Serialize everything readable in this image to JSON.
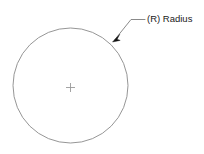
{
  "diagram": {
    "background_color": "#ffffff",
    "geometry": {
      "circle": {
        "name": "circle-outline",
        "center_x": 70.5,
        "center_y": 85.5,
        "radius": 57.5,
        "stroke_color": "#8a8a8a",
        "stroke_width": 0.9,
        "fill": "none"
      },
      "center_mark": {
        "name": "center-plus-mark",
        "x": 70.5,
        "y": 87.5,
        "arm_length": 4.5,
        "stroke_color": "#9a9a9a",
        "stroke_width": 0.9,
        "glyph": "+"
      }
    },
    "callout": {
      "label": "(R) Radius",
      "label_x": 147,
      "label_y": 22,
      "text_color": "#1a1a1a",
      "leader": {
        "name": "leader-line",
        "stroke_color": "#7d7d7d",
        "stroke_width": 0.9,
        "points": "114.5,40 131,19.5 145,19.5"
      },
      "arrowhead": {
        "name": "leader-arrowhead",
        "fill_color": "#121212",
        "tip_x": 112.5,
        "tip_y": 42,
        "points": "112.5,42 119.5,34.5 117,39 120,40"
      }
    }
  }
}
